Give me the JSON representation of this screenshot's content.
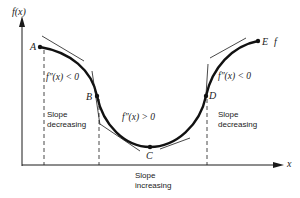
{
  "axes": {
    "y_label": "f(x)",
    "x_label": "x",
    "curve_label": "f"
  },
  "points": [
    {
      "name": "A",
      "x": 40,
      "y": 47
    },
    {
      "name": "B",
      "x": 97,
      "y": 96
    },
    {
      "name": "C",
      "x": 150,
      "y": 147
    },
    {
      "name": "D",
      "x": 206,
      "y": 96
    },
    {
      "name": "E",
      "x": 258,
      "y": 41
    }
  ],
  "annotations": {
    "concave_left": "f″(x) < 0",
    "convex_middle": "f″(x) > 0",
    "concave_right": "f″(x) < 0",
    "slope_left_line1": "Slope",
    "slope_left_line2": "decreasing",
    "slope_middle_line1": "Slope",
    "slope_middle_line2": "increasing",
    "slope_right_line1": "Slope",
    "slope_right_line2": "decreasing"
  },
  "colors": {
    "ink": "#1a1a1a",
    "background": "#ffffff"
  }
}
